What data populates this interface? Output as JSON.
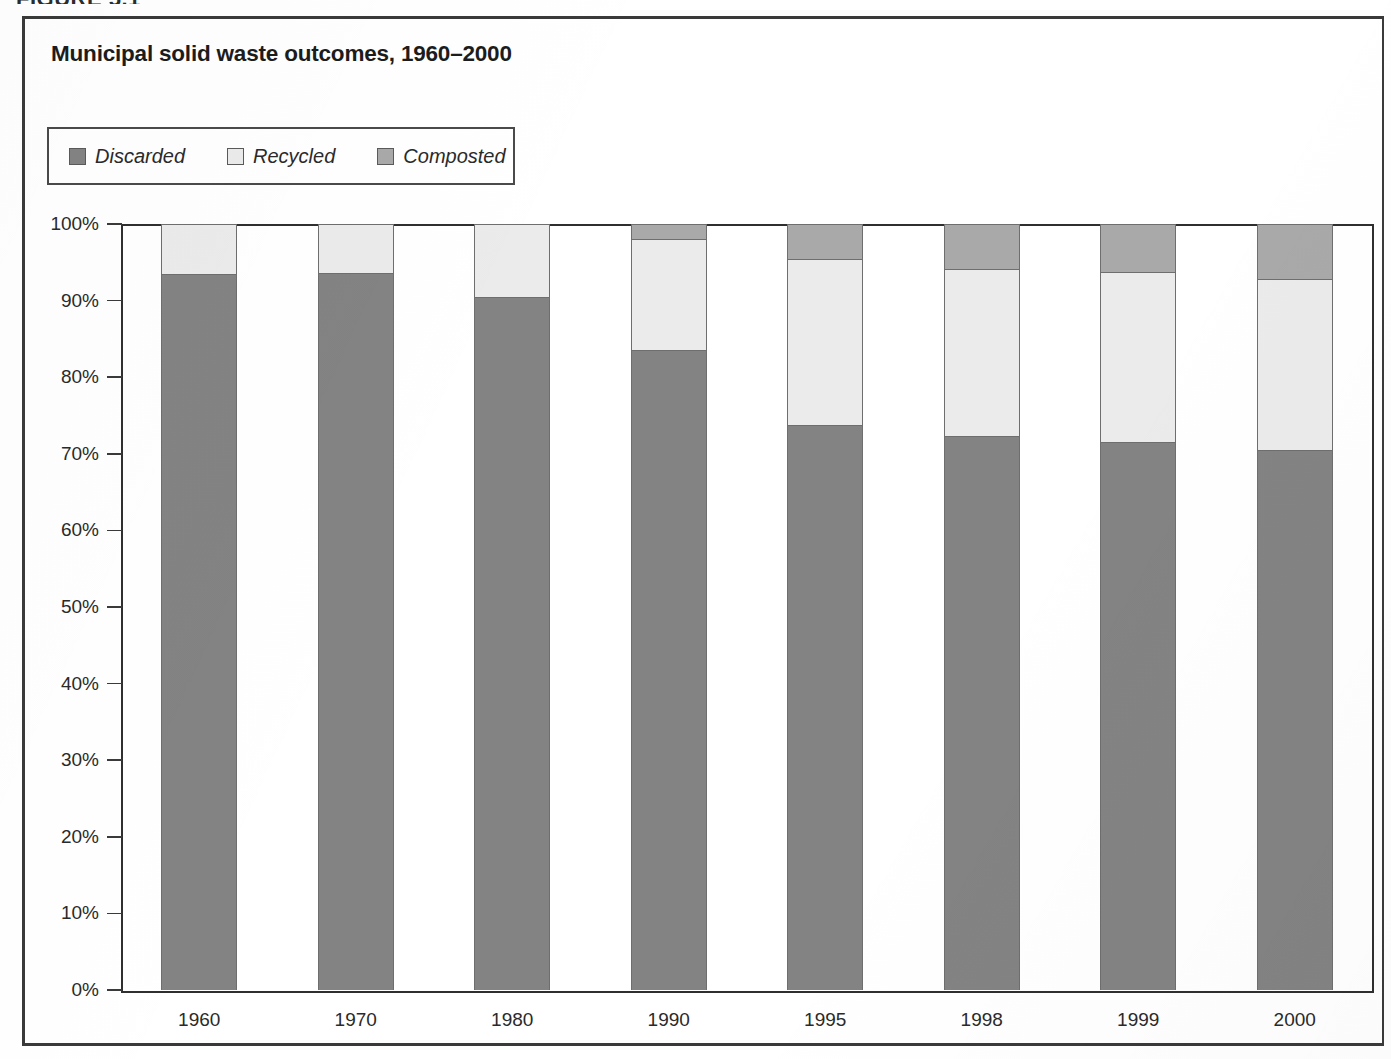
{
  "figure": {
    "caption": "FIGURE 5.1",
    "title": "Municipal solid waste outcomes, 1960–2000"
  },
  "legend": {
    "position": "top-left",
    "items": [
      {
        "label": "Discarded",
        "color": "#838383",
        "swatch_icon": "square-swatch-icon"
      },
      {
        "label": "Recycled",
        "color": "#ebebeb",
        "swatch_icon": "square-swatch-icon"
      },
      {
        "label": "Composted",
        "color": "#a9a9a9",
        "swatch_icon": "square-swatch-icon"
      }
    ]
  },
  "axes": {
    "y_tick_labels": [
      "100%",
      "90%",
      "80%",
      "70%",
      "60%",
      "50%",
      "40%",
      "30%",
      "20%",
      "10%",
      "0%"
    ],
    "y_tick_values": [
      100,
      90,
      80,
      70,
      60,
      50,
      40,
      30,
      20,
      10,
      0
    ],
    "x_tick_labels": [
      "1960",
      "1970",
      "1980",
      "1990",
      "1995",
      "1998",
      "1999",
      "2000"
    ]
  },
  "chart_data": {
    "type": "bar",
    "stacked": true,
    "title": "Municipal solid waste outcomes, 1960–2000",
    "xlabel": "",
    "ylabel": "",
    "ylim": [
      0,
      100
    ],
    "unit": "percent",
    "grid": false,
    "legend_position": "top-left",
    "categories": [
      "1960",
      "1970",
      "1980",
      "1990",
      "1995",
      "1998",
      "1999",
      "2000"
    ],
    "series": [
      {
        "name": "Discarded",
        "color": "#838383",
        "values": [
          93.5,
          93.6,
          90.5,
          83.5,
          73.7,
          72.3,
          71.6,
          70.5
        ]
      },
      {
        "name": "Recycled",
        "color": "#ebebeb",
        "values": [
          6.5,
          6.4,
          9.5,
          14.5,
          21.7,
          21.8,
          22.1,
          22.3
        ]
      },
      {
        "name": "Composted",
        "color": "#a9a9a9",
        "values": [
          0.0,
          0.0,
          0.0,
          2.0,
          4.6,
          5.9,
          6.3,
          7.2
        ]
      }
    ]
  }
}
